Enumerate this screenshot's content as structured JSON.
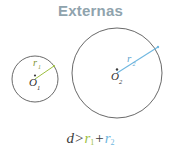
{
  "figure": {
    "title": "Externas",
    "title_color": "#8fa3ad",
    "background_color": "#ffffff",
    "stroke_color": "#585858"
  },
  "formula": {
    "distance_symbol": "d",
    "relation": ">",
    "radius1_symbol": "r",
    "radius1_sub": "1",
    "plus": "+",
    "radius2_symbol": "r",
    "radius2_sub": "2",
    "full_text": "d > r1 + r2"
  },
  "circles": [
    {
      "name": "small-circle",
      "center_label": "O",
      "center_sub": "1",
      "radius_label": "r",
      "radius_sub": "1",
      "radius_color": "#9dbf3f",
      "cx": 35,
      "cy": 79,
      "r": 23
    },
    {
      "name": "large-circle",
      "center_label": "O",
      "center_sub": "2",
      "radius_label": "r",
      "radius_sub": "2",
      "radius_color": "#6fb7e0",
      "cx": 117,
      "cy": 73,
      "r": 45
    }
  ]
}
